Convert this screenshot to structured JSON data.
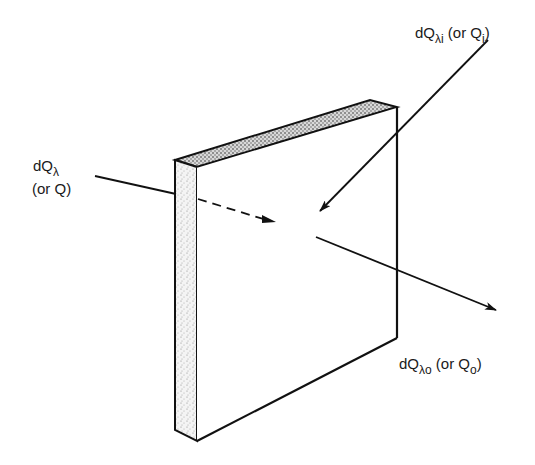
{
  "diagram": {
    "colors": {
      "ink": "#111111",
      "stipple": "#9a9a9a",
      "background": "#ffffff"
    },
    "labels": {
      "incident_left": {
        "main": "dQ",
        "sub": "λ",
        "alt": "(or  Q)"
      },
      "incident_top": {
        "main": "dQ",
        "sub": "λi",
        "alt_prefix": " (or  Q",
        "alt_sub": "i",
        "alt_suffix": ")"
      },
      "outgoing": {
        "main": "dQ",
        "sub": "λo",
        "alt_prefix": " (or  Q",
        "alt_sub": "o",
        "alt_suffix": ")"
      }
    },
    "elements": [
      "slab",
      "incident-arrow-left",
      "incident-arrow-top",
      "outgoing-arrow"
    ]
  }
}
